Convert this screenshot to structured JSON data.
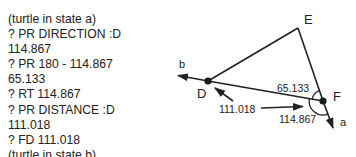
{
  "transcript": {
    "lines": [
      "(turtle in state a)",
      "? PR DIRECTION :D",
      "114.867",
      "? PR 180 - 114.867",
      "65.133",
      "? RT 114.867",
      "? PR DISTANCE :D",
      "111.018",
      "? FD 111.018",
      "(turtle in state b)"
    ]
  },
  "diagram": {
    "points": {
      "D": "D",
      "E": "E",
      "F": "F"
    },
    "states": {
      "a": "a",
      "b": "b"
    },
    "labels": {
      "angle_inner": "65.133",
      "angle_turn": "114.867",
      "distance": "111.018"
    }
  }
}
